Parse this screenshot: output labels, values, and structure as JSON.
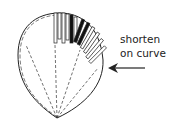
{
  "diagram": {
    "label_line1": "shorten",
    "label_line2": "on curve",
    "arrow_direction": "left",
    "stroke_color": "#222222",
    "fill_color": "#111111"
  }
}
